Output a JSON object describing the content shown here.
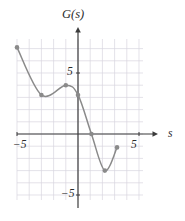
{
  "figure": {
    "name": "function-graph",
    "width": 185,
    "height": 221,
    "background_color": "#ffffff"
  },
  "labels": {
    "y_axis_title": "G(s)",
    "x_axis_title": "s",
    "x_tick_negative": "−5",
    "x_tick_positive": "5",
    "y_tick_positive": "5",
    "y_tick_negative": "−5"
  },
  "style": {
    "grid_color": "#d9d6e0",
    "axis_color": "#3b3b3b",
    "curve_color": "#8a8a8a",
    "point_color": "#8a8a8a",
    "text_color": "#2b2b2b"
  },
  "chart_data": {
    "type": "line",
    "title": "G(s)",
    "xlabel": "s",
    "ylabel": "G(s)",
    "xlim": [
      -6,
      5.5
    ],
    "ylim": [
      -7.5,
      5.8
    ],
    "grid": true,
    "grid_step": 1,
    "legend": null,
    "axis_ticks": {
      "x": [
        -5,
        5
      ],
      "y": [
        -5,
        5
      ]
    },
    "series": [
      {
        "name": "G(s)",
        "marker": "filled-circle",
        "smooth": true,
        "points": [
          {
            "x": -5.0,
            "y": 7.1,
            "label": "left endpoint"
          },
          {
            "x": -3.0,
            "y": 3.2,
            "label": "local minimum"
          },
          {
            "x": -1.0,
            "y": 4.0,
            "label": "local maximum"
          },
          {
            "x": 0.0,
            "y": 3.2,
            "label": "y-intercept"
          },
          {
            "x": 1.1,
            "y": 0.0,
            "label": "x-intercept"
          },
          {
            "x": 2.2,
            "y": -3.0,
            "label": "local minimum"
          },
          {
            "x": 3.2,
            "y": -1.1,
            "label": "right endpoint"
          }
        ]
      }
    ]
  },
  "geometry": {
    "origin": {
      "x": 78,
      "y": 134
    },
    "unit_px": 12.2,
    "grid_rect": {
      "x": 17,
      "y": 39,
      "width": 126,
      "height": 161
    },
    "x_axis": {
      "x1": 17,
      "x2": 158,
      "y": 134
    },
    "y_axis": {
      "x": 78,
      "y1": 27,
      "y2": 208
    },
    "point_radius": 2.3,
    "curve_width": 1.5
  }
}
